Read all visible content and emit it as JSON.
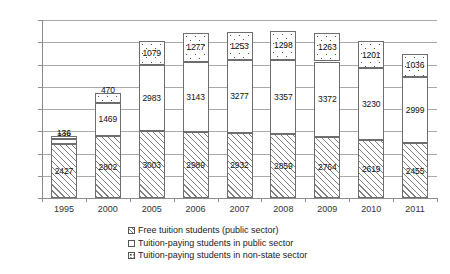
{
  "chart_data": {
    "type": "bar",
    "subtype": "stacked-bar",
    "title": "",
    "xlabel": "",
    "ylabel": "",
    "ylim": [
      0,
      8000
    ],
    "ytick_labels": [
      "0",
      "1,000",
      "2,000",
      "3,000",
      "4,000",
      "5,000",
      "6,000",
      "7,000",
      "8,000"
    ],
    "ytick_values": [
      0,
      1000,
      2000,
      3000,
      4000,
      5000,
      6000,
      7000,
      8000
    ],
    "grid": "horizontal",
    "legend_position": "bottom",
    "categories": [
      "1995",
      "2000",
      "2005",
      "2006",
      "2007",
      "2008",
      "2009",
      "2010",
      "2011"
    ],
    "series": [
      {
        "name": "Free tuition students (public sector)",
        "pattern": "diagonal-hatch",
        "values": [
          2427,
          2802,
          3003,
          2989,
          2932,
          2859,
          2764,
          2619,
          2455
        ]
      },
      {
        "name": "Tuition-paying students in public sector",
        "pattern": "solid-white",
        "values": [
          228,
          1469,
          2983,
          3143,
          3277,
          3357,
          3372,
          3230,
          2999
        ]
      },
      {
        "name": "Tuition-paying students in non-state sector",
        "pattern": "dotted",
        "values": [
          136,
          470,
          1079,
          1277,
          1253,
          1298,
          1263,
          1201,
          1036
        ]
      }
    ],
    "totals": [
      2791,
      4741,
      7065,
      7409,
      7462,
      7514,
      7399,
      7050,
      6490
    ]
  },
  "legend": {
    "items": [
      {
        "label": "Free tuition students (public sector)",
        "swatch": "hatch-swatch-icon"
      },
      {
        "label": "Tuition-paying students in public sector",
        "swatch": "white-swatch-icon"
      },
      {
        "label": "Tuition-paying students in non-state sector",
        "swatch": "dotted-swatch-icon"
      }
    ]
  },
  "colors": {
    "background": "#ffffff",
    "grid": "#a9a9a9",
    "axis": "#8c8c8c",
    "bar_outline": "#6e6e6e",
    "text": "#1a1a1a"
  }
}
